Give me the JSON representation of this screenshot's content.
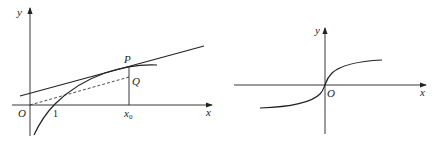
{
  "left_figure": {
    "axis_labels": {
      "x": "x",
      "y": "y"
    },
    "origin_label": "O",
    "tick_labels": {
      "one": "1",
      "x0_main": "x",
      "x0_sub": "0"
    },
    "point_labels": {
      "P": "P",
      "Q": "Q"
    },
    "elements": [
      "curve (logarithmic, crosses x-axis at 1)",
      "tangent line at P",
      "dashed segment O to Q",
      "vertical segment from P to x0"
    ]
  },
  "right_figure": {
    "axis_labels": {
      "x": "x",
      "y": "y"
    },
    "origin_label": "O",
    "elements": [
      "odd increasing S-shaped curve through origin"
    ]
  },
  "colors": {
    "stroke": "#222222",
    "background": "#ffffff"
  }
}
